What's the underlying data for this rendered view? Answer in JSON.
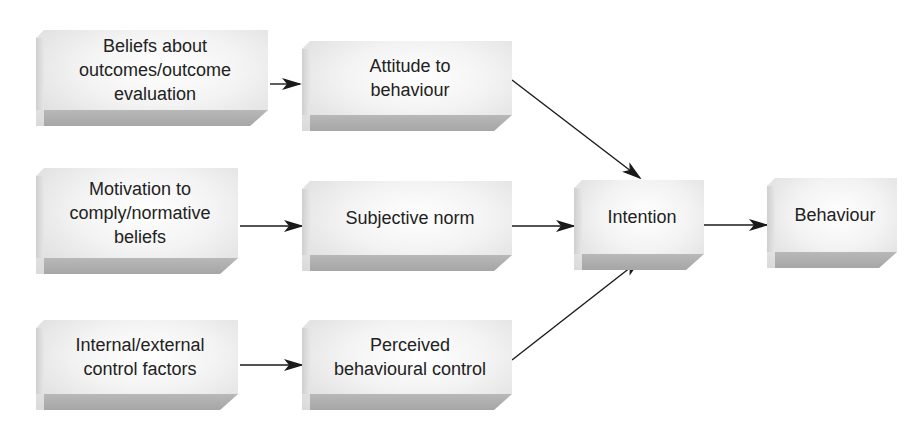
{
  "diagram": {
    "type": "flow",
    "colors": {
      "box_face": "#efefef",
      "box_bottom": "#aaaaaa",
      "arrow": "#1a1a1a",
      "text": "#222222"
    },
    "nodes": [
      {
        "id": "beliefs",
        "label": "Beliefs about\noutcomes/outcome\nevaluation"
      },
      {
        "id": "motivation",
        "label": "Motivation to\ncomply/normative\nbeliefs"
      },
      {
        "id": "control_factors",
        "label": "Internal/external\ncontrol factors"
      },
      {
        "id": "attitude",
        "label": "Attitude to\nbehaviour"
      },
      {
        "id": "subjective_norm",
        "label": "Subjective norm"
      },
      {
        "id": "pbc",
        "label": "Perceived\nbehavioural control"
      },
      {
        "id": "intention",
        "label": "Intention"
      },
      {
        "id": "behaviour",
        "label": "Behaviour"
      }
    ],
    "edges": [
      {
        "from": "beliefs",
        "to": "attitude"
      },
      {
        "from": "motivation",
        "to": "subjective_norm"
      },
      {
        "from": "control_factors",
        "to": "pbc"
      },
      {
        "from": "attitude",
        "to": "intention"
      },
      {
        "from": "subjective_norm",
        "to": "intention"
      },
      {
        "from": "pbc",
        "to": "intention"
      },
      {
        "from": "intention",
        "to": "behaviour"
      }
    ]
  }
}
